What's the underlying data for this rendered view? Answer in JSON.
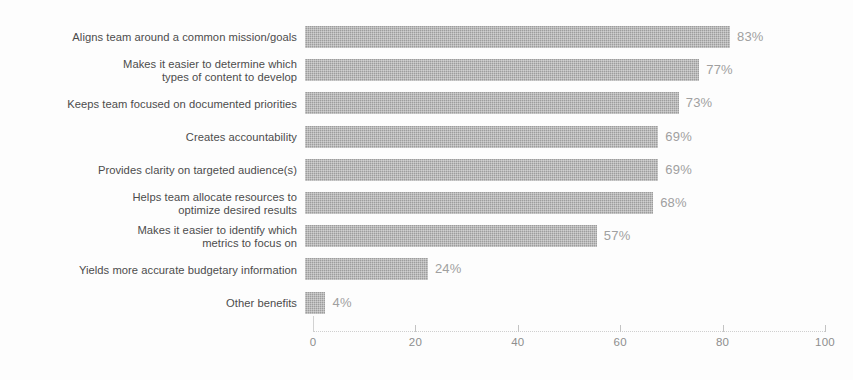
{
  "chart_data": {
    "type": "bar",
    "orientation": "horizontal",
    "title": "",
    "xlabel": "",
    "ylabel": "",
    "xlim": [
      0,
      100
    ],
    "xticks": [
      0,
      20,
      40,
      60,
      80,
      100
    ],
    "grid": false,
    "legend": false,
    "value_suffix": "%",
    "bar_color": "#9d9d9d",
    "value_label_color": "#a0a0a0",
    "category_label_color": "#4c4c4c",
    "axis_color": "#cfcfcf",
    "background_color": "#fdfdfd",
    "categories": [
      "Aligns team around a common mission/goals",
      "Makes it easier to determine which\ntypes of content to develop",
      "Keeps team focused on documented priorities",
      "Creates accountability",
      "Provides clarity on targeted audience(s)",
      "Helps team allocate resources to\noptimize desired results",
      "Makes it easier to identify which\nmetrics to focus on",
      "Yields more accurate budgetary information",
      "Other benefits"
    ],
    "values": [
      83,
      77,
      73,
      69,
      69,
      68,
      57,
      24,
      4
    ],
    "value_labels": [
      "83%",
      "77%",
      "73%",
      "69%",
      "69%",
      "68%",
      "57%",
      "24%",
      "4%"
    ],
    "tick_labels": [
      "0",
      "20",
      "40",
      "60",
      "80",
      "100"
    ]
  }
}
